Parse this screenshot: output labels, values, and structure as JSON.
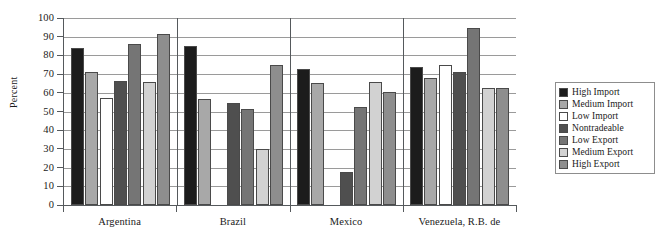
{
  "chart_data": {
    "type": "bar",
    "title": "",
    "xlabel": "",
    "ylabel": "Percent",
    "ylim": [
      0,
      100
    ],
    "ytick_step": 10,
    "yticks": [
      100,
      90,
      80,
      70,
      60,
      50,
      40,
      30,
      20,
      10,
      0
    ],
    "grid": true,
    "legend_position": "right",
    "categories": [
      "Argentina",
      "Brazil",
      "Mexico",
      "Venezuela, R.B. de"
    ],
    "series": [
      {
        "name": "High Import",
        "color": "#1c1c1c",
        "values": [
          84.0,
          85.2,
          73.0,
          74.0
        ]
      },
      {
        "name": "Medium Import",
        "color": "#a8a8a8",
        "values": [
          71.0,
          56.8,
          65.5,
          68.0
        ]
      },
      {
        "name": "Low Import",
        "color": "#ffffff",
        "values": [
          57.0,
          0.0,
          0.0,
          75.0
        ]
      },
      {
        "name": "Nontradeable",
        "color": "#4f4f4f",
        "values": [
          66.5,
          54.8,
          17.5,
          71.0
        ]
      },
      {
        "name": "Low Export",
        "color": "#757575",
        "values": [
          86.0,
          51.3,
          52.5,
          94.5
        ]
      },
      {
        "name": "Medium Export",
        "color": "#d2d2d2",
        "values": [
          66.0,
          30.0,
          66.0,
          62.5
        ]
      },
      {
        "name": "High Export",
        "color": "#8e8e8e",
        "values": [
          91.5,
          75.0,
          60.5,
          62.5
        ]
      }
    ]
  },
  "axis": {
    "y_title": "Percent",
    "y_labels": [
      "100",
      "90",
      "80",
      "70",
      "60",
      "50",
      "40",
      "30",
      "20",
      "10",
      "0"
    ],
    "x_labels": [
      "Argentina",
      "Brazil",
      "Mexico",
      "Venezuela, R.B. de"
    ]
  },
  "legend": {
    "items": [
      {
        "label": "High Import",
        "color": "#1c1c1c"
      },
      {
        "label": "Medium Import",
        "color": "#a8a8a8"
      },
      {
        "label": "Low Import",
        "color": "#ffffff"
      },
      {
        "label": "Nontradeable",
        "color": "#4f4f4f"
      },
      {
        "label": "Low Export",
        "color": "#757575"
      },
      {
        "label": "Medium Export",
        "color": "#d2d2d2"
      },
      {
        "label": "High Export",
        "color": "#8e8e8e"
      }
    ]
  }
}
